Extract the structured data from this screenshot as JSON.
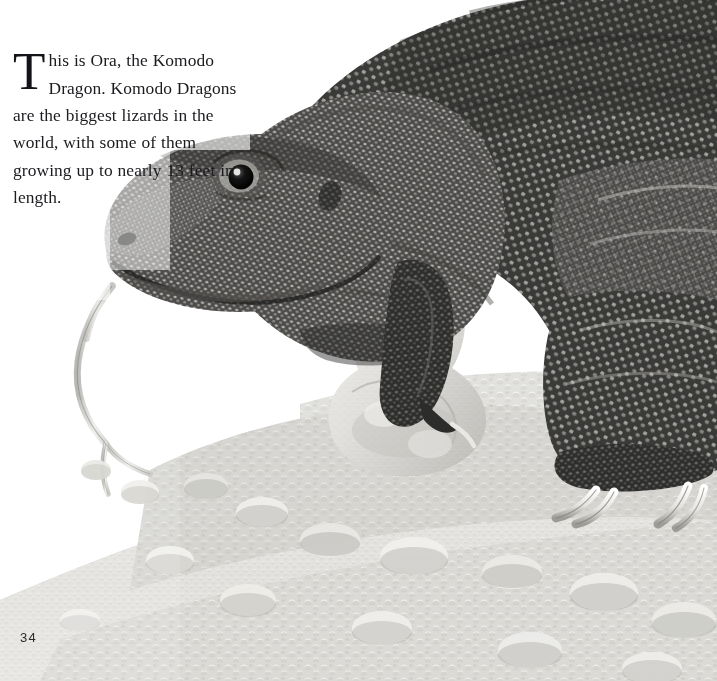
{
  "page": {
    "kind": "illustrated-book-page",
    "folio": "34",
    "background_color": "#ffffff",
    "ink_color": "#1c1c20"
  },
  "running_text_top": {
    "cropped": true,
    "marker": "3",
    "text": "anything they can catch",
    "color": "#b2b2b2"
  },
  "body": {
    "dropcap": "T",
    "paragraph": "his is Ora, the Komodo Dragon. Komodo Dragons are the biggest lizards in the world, with some of them growing up to nearly 13 feet in length.",
    "full_text": "This is Ora, the Komodo Dragon. Komodo Dragons are the biggest lizards in the world, with some of them growing up to nearly 13 feet in length.",
    "lines": [
      "his is Ora, the Komodo",
      "Dragon. Komodo",
      "Dragons are the",
      "biggest lizards in",
      "the world, with",
      "some of them",
      "growing up",
      "to nearly",
      "13 feet in",
      "length."
    ]
  },
  "illustration": {
    "subject": "Komodo Dragon",
    "subject_name": "Ora",
    "medium": "graphite / pen-and-ink stipple drawing",
    "scene": "large monitor lizard standing on a pebble-strewn rocky ground, head lowered to the left, forked tongue extended",
    "palette": {
      "paper": "#ffffff",
      "ground_light": "#e7e6e3",
      "ground_mid": "#b9b7b2",
      "ground_dark": "#8e8c88",
      "hide_light": "#bdbcb8",
      "hide_mid": "#7b7a77",
      "hide_dark": "#3e3e3d",
      "hide_deep": "#222222",
      "claw": "#f2f1ee",
      "eye": "#101010",
      "tongue": "#d8d7d4"
    },
    "parts": [
      {
        "name": "head",
        "label": "head with lowered snout"
      },
      {
        "name": "eye",
        "label": "dark round eye with pale ring"
      },
      {
        "name": "nostril",
        "label": "nostril"
      },
      {
        "name": "tongue",
        "label": "long forked tongue"
      },
      {
        "name": "neck",
        "label": "folded scaly neck"
      },
      {
        "name": "body",
        "label": "heavy scaled body"
      },
      {
        "name": "foreleg",
        "label": "foreleg behind rock"
      },
      {
        "name": "hind-leg",
        "label": "hind leg with claws"
      },
      {
        "name": "claws",
        "label": "pale curved claws"
      },
      {
        "name": "rocks",
        "label": "pebbles and boulders"
      },
      {
        "name": "boulder",
        "label": "large pale boulder"
      }
    ]
  }
}
